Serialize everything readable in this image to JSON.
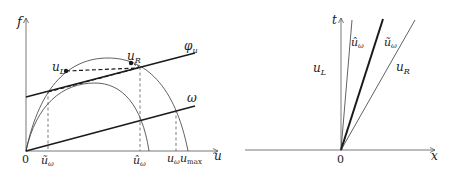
{
  "left_panel": {
    "axes": {
      "y_label": "f",
      "x_label": "u",
      "origin_label": "0"
    },
    "curves": {
      "phi_label": "φ",
      "phi_sub": "u",
      "omega_label": "ω"
    },
    "points": {
      "uL_main": "u",
      "uL_sub": "L",
      "uR_main": "u",
      "uR_sub": "R"
    },
    "ticks": [
      {
        "main": "ũ",
        "sub": "ω"
      },
      {
        "main": "û",
        "sub": "ω"
      },
      {
        "main": "u",
        "sub": "ω"
      },
      {
        "main": "u",
        "sub": "max"
      }
    ],
    "colors": {
      "ink": "#1a1a1a",
      "thin": "#3a3a3a"
    }
  },
  "right_panel": {
    "axes": {
      "t_label": "t",
      "x_label": "x",
      "origin_label": "0"
    },
    "regions": [
      {
        "main": "u",
        "sub": "L"
      },
      {
        "main": "û",
        "sub": "ω"
      },
      {
        "main": "ũ",
        "sub": "ω"
      },
      {
        "main": "u",
        "sub": "R"
      }
    ]
  }
}
